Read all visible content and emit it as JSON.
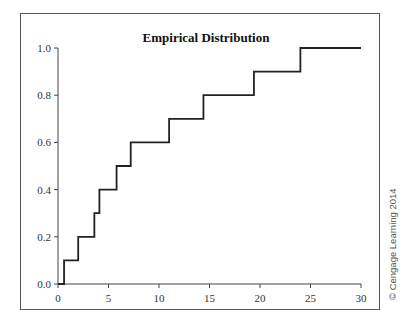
{
  "chart_data": {
    "type": "line",
    "subtype": "step",
    "title": "Empirical Distribution",
    "xlabel": "",
    "ylabel": "",
    "xlim": [
      0,
      30
    ],
    "ylim": [
      0.0,
      1.0
    ],
    "x_ticks": [
      0,
      5,
      10,
      15,
      20,
      25,
      30
    ],
    "x_tick_labels": [
      "0",
      "5",
      "10",
      "15",
      "20",
      "25",
      "30"
    ],
    "y_ticks": [
      0.0,
      0.2,
      0.4,
      0.6,
      0.8,
      1.0
    ],
    "y_tick_labels": [
      "0.0",
      "0.2",
      "0.4",
      "0.6",
      "0.8",
      "1.0"
    ],
    "grid": false,
    "legend": null,
    "series": [
      {
        "name": "Empirical CDF",
        "x": [
          0,
          0.6,
          2.0,
          3.6,
          4.1,
          5.8,
          7.2,
          11.0,
          14.4,
          19.4,
          24.0,
          30.0
        ],
        "y": [
          0.0,
          0.1,
          0.2,
          0.3,
          0.4,
          0.5,
          0.6,
          0.7,
          0.8,
          0.9,
          1.0,
          1.0
        ]
      }
    ]
  },
  "title": "Empirical Distribution",
  "credit": "© Cengage Learning 2014"
}
